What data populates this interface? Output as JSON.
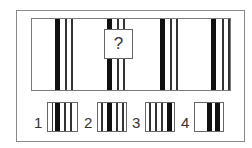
{
  "puzzle": {
    "question_mark": "?",
    "pattern": {
      "groups": [
        {
          "thick_x": 54,
          "thin_x": [
            64,
            70
          ]
        },
        {
          "thick_x": 106,
          "thin_x": [
            116,
            122
          ],
          "hidden_by_question_box": true
        },
        {
          "thick_x": 159,
          "thin_x": [
            169,
            175
          ]
        },
        {
          "thick_x": 211,
          "thin_x": [
            222,
            228
          ]
        }
      ]
    },
    "options": [
      {
        "label": "1",
        "description": "thick bar on left, then three thin bars"
      },
      {
        "label": "2",
        "description": "thin bar, thick bar, then two thin bars"
      },
      {
        "label": "3",
        "description": "three thin bars then thick bar on right"
      },
      {
        "label": "4",
        "description": "two thick bars with white gap between"
      }
    ]
  },
  "colors": {
    "bar": "#111111",
    "frame": "#8a8a8a",
    "background": "#ffffff"
  }
}
